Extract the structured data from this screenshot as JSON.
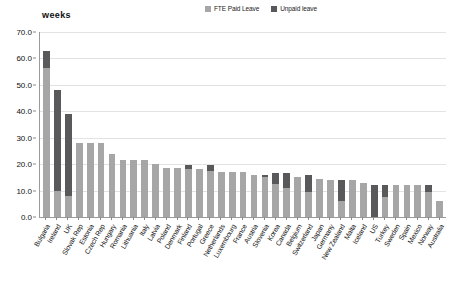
{
  "chart_data": {
    "type": "bar",
    "subtype": "stacked-vertical",
    "title": "",
    "xlabel": "",
    "ylabel": "weeks",
    "ylim": [
      0,
      70
    ],
    "ytick_step": 10,
    "ytick_labels": [
      "0.0",
      "10.0",
      "20.0",
      "30.0",
      "40.0",
      "50.0",
      "60.0",
      "70.0"
    ],
    "grid": true,
    "legend_position": "top-right",
    "legend": [
      {
        "name": "FTE Paid Leave",
        "color": "#a6a6a6"
      },
      {
        "name": "Unpaid leave",
        "color": "#59595b"
      }
    ],
    "categories": [
      "Bulgaria",
      "Ireland",
      "UK",
      "Slovak Rep",
      "Estonia",
      "Czech Rep",
      "Hungary",
      "Romania",
      "Lithuania",
      "Italy",
      "Latvia",
      "Poland",
      "Denmark",
      "Finland",
      "Portugal",
      "Greece",
      "Netherlands",
      "Luxembourg",
      "France",
      "Austria",
      "Slovenia",
      "Korea",
      "Canada",
      "Belgium",
      "Switzerland",
      "Japan",
      "Germany",
      "New Zealand",
      "Malta",
      "Iceland",
      "US",
      "Turkey",
      "Sweden",
      "Spain",
      "Mexico",
      "Norway",
      "Australia"
    ],
    "series": [
      {
        "name": "FTE Paid Leave",
        "color": "#a6a6a6",
        "values": [
          56.5,
          10.0,
          8.0,
          28.0,
          28.0,
          28.0,
          24.0,
          21.5,
          21.5,
          21.5,
          20.0,
          18.5,
          18.5,
          18.0,
          18.0,
          17.5,
          17.0,
          17.0,
          17.0,
          16.0,
          15.0,
          12.5,
          11.0,
          15.0,
          9.5,
          14.5,
          14.0,
          6.0,
          14.0,
          13.0,
          0.0,
          7.5,
          12.0,
          12.0,
          12.0,
          9.5,
          6.0
        ]
      },
      {
        "name": "Unpaid leave",
        "color": "#59595b",
        "values": [
          6.5,
          38.0,
          31.0,
          0.0,
          0.0,
          0.0,
          0.0,
          0.0,
          0.0,
          0.0,
          0.0,
          0.0,
          0.0,
          1.5,
          0.0,
          2.0,
          0.0,
          0.0,
          0.0,
          0.0,
          1.0,
          4.0,
          5.5,
          0.0,
          6.5,
          0.0,
          0.0,
          8.0,
          0.0,
          0.0,
          12.0,
          4.5,
          0.0,
          0.0,
          0.0,
          2.5,
          0.0
        ]
      }
    ],
    "totals": [
      63.0,
      48.0,
      39.0,
      28.0,
      28.0,
      28.0,
      24.0,
      21.5,
      21.5,
      21.5,
      20.0,
      18.5,
      18.5,
      19.5,
      18.0,
      19.5,
      17.0,
      17.0,
      17.0,
      16.0,
      16.0,
      16.5,
      16.5,
      15.0,
      16.0,
      14.5,
      14.0,
      14.0,
      14.0,
      13.0,
      12.0,
      12.0,
      12.0,
      12.0,
      12.0,
      12.0,
      6.0
    ]
  }
}
